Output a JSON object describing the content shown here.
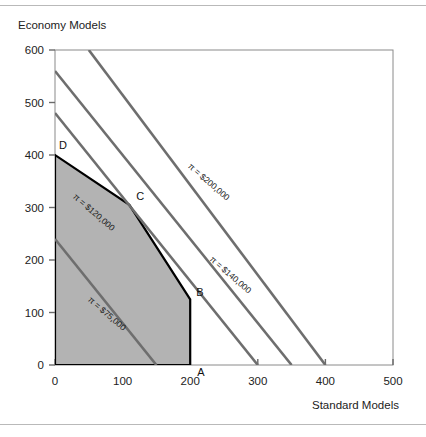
{
  "figure": {
    "background": "#ffffff",
    "rule_color": "#b9b9b9"
  },
  "chart_data": {
    "type": "line",
    "title": "",
    "xlabel": "Standard Models",
    "ylabel": "Economy Models",
    "xlim": [
      0,
      500
    ],
    "ylim": [
      0,
      600
    ],
    "xticks": [
      0,
      100,
      200,
      300,
      400,
      500
    ],
    "yticks": [
      0,
      100,
      200,
      300,
      400,
      500,
      600
    ],
    "xtick_labels": [
      "0",
      "100",
      "200",
      "300",
      "400",
      "500"
    ],
    "ytick_labels": [
      "0",
      "100",
      "200",
      "300",
      "400",
      "500",
      "600"
    ],
    "grid": false,
    "legend": "none",
    "feasible_region": {
      "name": "feasible-region",
      "fill": "#b3b3b3",
      "edge": "#000000",
      "vertices": [
        {
          "label": "",
          "x": 0,
          "y": 0
        },
        {
          "label": "D",
          "x": 0,
          "y": 400
        },
        {
          "label": "C",
          "x": 110,
          "y": 305
        },
        {
          "label": "B",
          "x": 200,
          "y": 125
        },
        {
          "label": "A",
          "x": 200,
          "y": 0
        }
      ]
    },
    "vertex_labels": [
      {
        "name": "vertex-label-d",
        "text": "D",
        "x": 0,
        "y": 400
      },
      {
        "name": "vertex-label-c",
        "text": "C",
        "x": 110,
        "y": 305
      },
      {
        "name": "vertex-label-b",
        "text": "B",
        "x": 200,
        "y": 125
      },
      {
        "name": "vertex-label-a",
        "text": "A",
        "x": 200,
        "y": 0
      }
    ],
    "series": [
      {
        "name": "iso-profit-75000",
        "label": "π = $75,000",
        "color": "#6e6e6e",
        "x": [
          0,
          150
        ],
        "y": [
          240,
          0
        ]
      },
      {
        "name": "iso-profit-120000",
        "label": "π = $120,000",
        "color": "#6e6e6e",
        "x": [
          0,
          300
        ],
        "y": [
          480,
          0
        ]
      },
      {
        "name": "iso-profit-140000",
        "label": "π = $140,000",
        "color": "#6e6e6e",
        "x": [
          0,
          350
        ],
        "y": [
          560,
          0
        ]
      },
      {
        "name": "iso-profit-200000",
        "label": "π = $200,000",
        "color": "#6e6e6e",
        "x": [
          50,
          400
        ],
        "y": [
          600,
          0
        ]
      }
    ],
    "annotations": [
      {
        "name": "iso-label-75000",
        "text": "π = $75,000",
        "x": 48,
        "y": 123
      },
      {
        "name": "iso-label-120000",
        "text": "π = $120,000",
        "x": 26,
        "y": 319
      },
      {
        "name": "iso-label-140000",
        "text": "π = $140,000",
        "x": 228,
        "y": 200
      },
      {
        "name": "iso-label-200000",
        "text": "π = $200,000",
        "x": 196,
        "y": 377
      }
    ]
  }
}
